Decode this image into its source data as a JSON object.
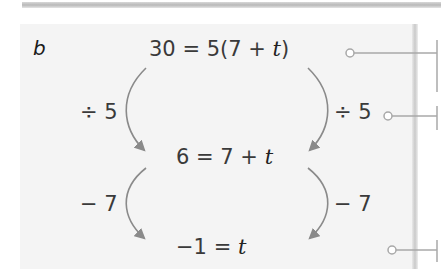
{
  "part_label": "b",
  "steps": [
    {
      "lhs": "30",
      "eq": " = ",
      "rhs_prefix": "5(7 + ",
      "var": "t",
      "rhs_suffix": ")"
    },
    {
      "lhs": "6",
      "eq": " = ",
      "rhs_prefix": "7 + ",
      "var": "t",
      "rhs_suffix": ""
    },
    {
      "lhs": "−1",
      "eq": " = ",
      "rhs_prefix": "",
      "var": "t",
      "rhs_suffix": ""
    }
  ],
  "operations": [
    {
      "left": "÷ 5",
      "right": "÷ 5"
    },
    {
      "left": "− 7",
      "right": "− 7"
    }
  ],
  "colors": {
    "arrow": "#8a8a8a",
    "text": "#3a3a3a",
    "callout": "#a8a8a8"
  }
}
